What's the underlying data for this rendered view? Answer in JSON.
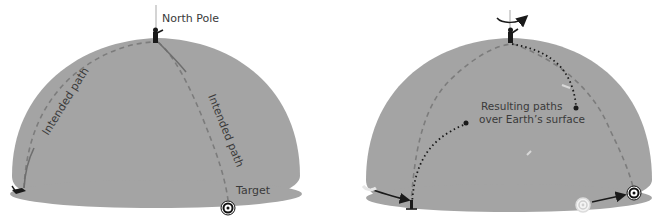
{
  "colors": {
    "earth": "#a4a4a4",
    "earth_edge": "#9a9a9a",
    "dashed_path": "#7c7c7c",
    "dotted_path": "#1a1a1a",
    "text": "#3a3a3a",
    "target": "#111111"
  },
  "left_panel": {
    "pole_label": "North Pole",
    "path_label_left": "Intended path",
    "path_label_right": "Intended path",
    "target_label": "Target",
    "icons": [
      "pole-axis-icon",
      "person-at-pole-icon",
      "person-at-base-icon",
      "target-icon"
    ]
  },
  "right_panel": {
    "result_label_line1": "Resulting paths",
    "result_label_line2": "over Earth’s surface",
    "icons": [
      "rotation-arrow-icon",
      "person-at-pole-icon",
      "person-at-base-icon",
      "original-target-icon",
      "moved-target-icon"
    ]
  }
}
